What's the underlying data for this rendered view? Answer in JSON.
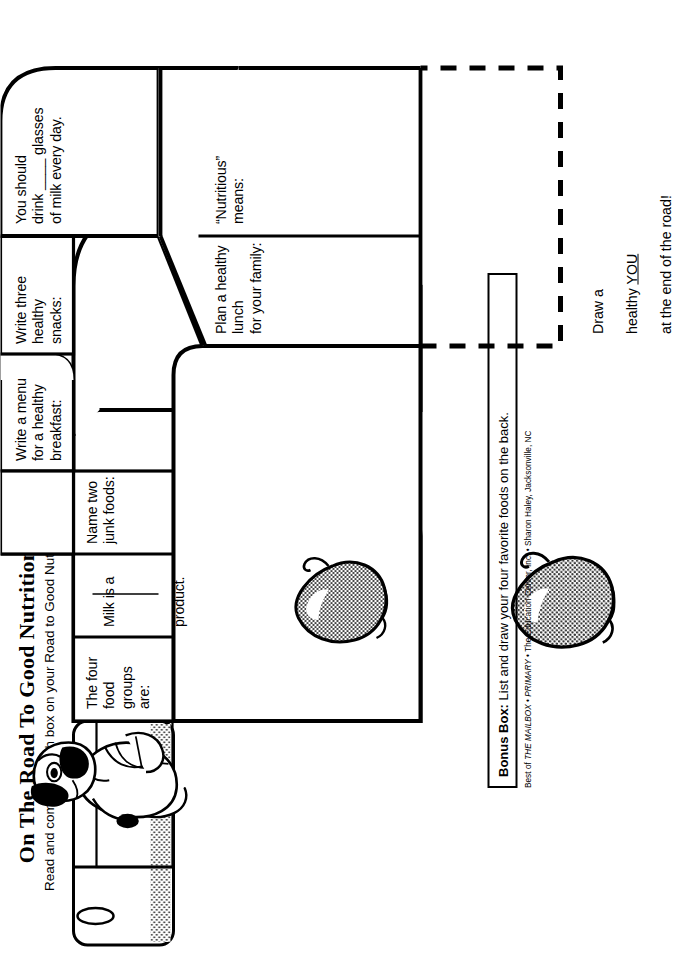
{
  "header": {
    "title": "On The Road To Good Nutrition",
    "subtitle": "Read and complete each box on your Road to Good Nutrition."
  },
  "road": {
    "cells": [
      {
        "id": "four-food-groups",
        "label": "The four food\ngroups are:"
      },
      {
        "id": "milk-product",
        "label": "Milk is a\n\n\n_______\nproduct."
      },
      {
        "id": "junk-foods",
        "label": "Name two\njunk foods:"
      },
      {
        "id": "breakfast-menu",
        "label": "Write a menu\nfor a healthy\nbreakfast:"
      },
      {
        "id": "healthy-snacks",
        "label": "Write three healthy\nsnacks:"
      },
      {
        "id": "milk-glasses",
        "label": "You should\ndrink ____ glasses\nof milk every day."
      },
      {
        "id": "nutritious-means",
        "label": "“Nutritious”\nmeans:"
      },
      {
        "id": "healthy-lunch",
        "label": "Plan a healthy lunch\nfor your family:"
      }
    ]
  },
  "milk_line": {
    "text_before": "Milk is a",
    "text_after": "product."
  },
  "draw_you": {
    "line1": "Draw a",
    "line2_pre": "healthy ",
    "line2_underlined": "YOU",
    "line3": "at the end of the road!"
  },
  "bonus": {
    "label": "Bonus Box:",
    "text": " List and draw your four favorite foods on the back."
  },
  "credit": {
    "prefix": "Best of ",
    "italic1": "THE MAILBOX",
    "sep1": " • ",
    "italic2": "PRIMARY",
    "sep2": " • ",
    "publisher": "The Education Center, Inc.",
    "sep3": " • ",
    "author": "Sharon Haley, Jacksonville, NC"
  },
  "illustrations": [
    {
      "id": "dog-walking-icon",
      "name": "cartoon dog walking with backpack"
    },
    {
      "id": "apple-icon-1",
      "name": "shaded apple"
    },
    {
      "id": "apple-icon-2",
      "name": "shaded apple"
    }
  ],
  "colors": {
    "ink": "#000000",
    "paper": "#ffffff",
    "halftone": "#8a8a8a"
  }
}
